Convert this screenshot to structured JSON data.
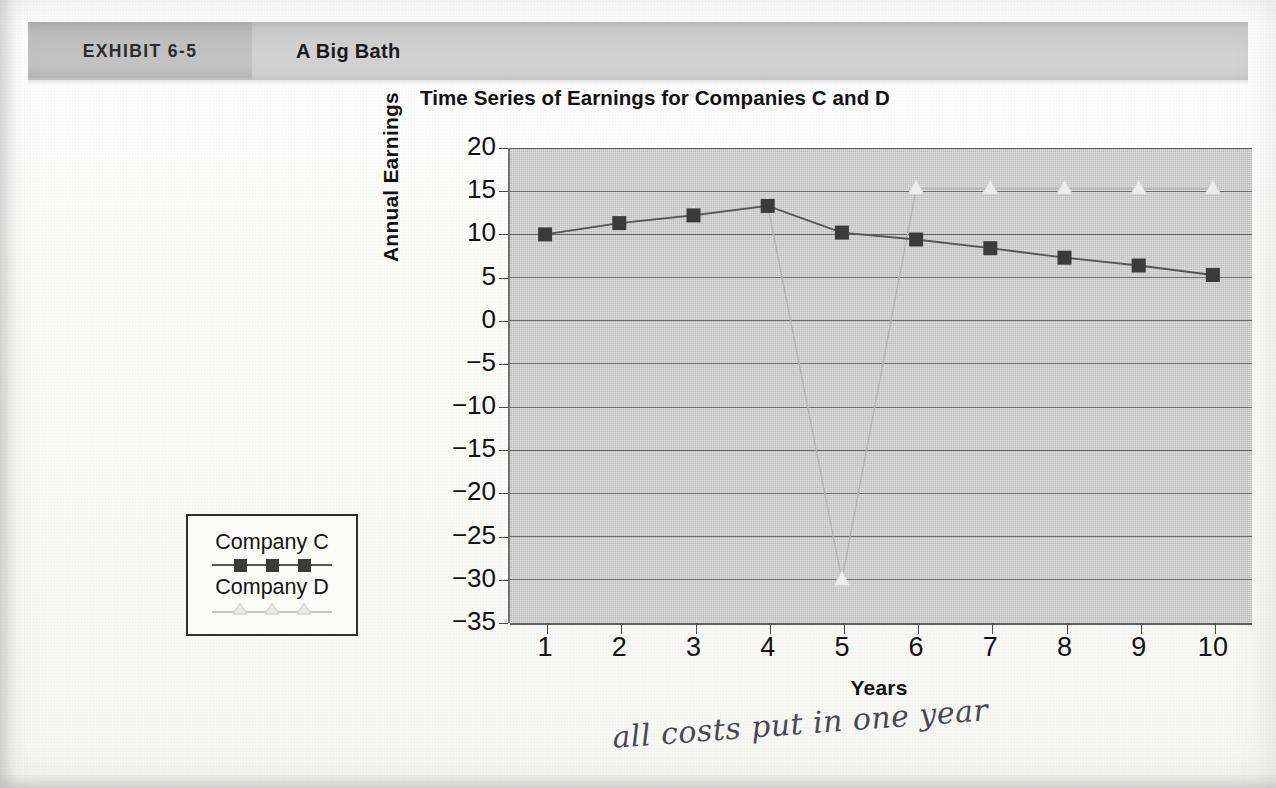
{
  "header": {
    "exhibit_label": "EXHIBIT 6-5",
    "title": "A Big Bath"
  },
  "chart_title": "Time Series of Earnings for Companies C and D",
  "legend": {
    "series_c_label": "Company C",
    "series_d_label": "Company D"
  },
  "annotation": {
    "handwritten_note": "all costs put in one year"
  },
  "colors": {
    "plot_background": "#c9c9c9",
    "gridline": "#6b6b6b",
    "series_c_marker": "#3b3b3b",
    "series_c_line": "#555555",
    "series_d_marker": "#ededed",
    "series_d_line": "#b0b0b0",
    "header_bar": "#d2d2d2",
    "exhibit_block": "#bdbdbd",
    "text": "#111111"
  },
  "chart_data": {
    "type": "line",
    "title": "Time Series of Earnings for Companies C and D",
    "xlabel": "Years",
    "ylabel": "Annual Earnings",
    "x": [
      1,
      2,
      3,
      4,
      5,
      6,
      7,
      8,
      9,
      10
    ],
    "xtick_labels": [
      "1",
      "2",
      "3",
      "4",
      "5",
      "6",
      "7",
      "8",
      "9",
      "10"
    ],
    "ytick_labels": [
      "20",
      "15",
      "10",
      "5",
      "0",
      "−5",
      "−10",
      "−15",
      "−20",
      "−25",
      "−30",
      "−35"
    ],
    "ytick_values": [
      20,
      15,
      10,
      5,
      0,
      -5,
      -10,
      -15,
      -20,
      -25,
      -30,
      -35
    ],
    "ylim": [
      -35,
      20
    ],
    "xlim": [
      0.5,
      10.5
    ],
    "grid": true,
    "legend_position": "outside-left",
    "series": [
      {
        "name": "Company C",
        "marker": "square",
        "color": "#3b3b3b",
        "values": [
          10.0,
          11.3,
          12.2,
          13.3,
          10.2,
          9.4,
          8.4,
          7.3,
          6.4,
          5.3
        ]
      },
      {
        "name": "Company D",
        "marker": "triangle",
        "color": "#ededed",
        "values": [
          10.0,
          11.3,
          12.3,
          13.4,
          -30.0,
          15.3,
          15.3,
          15.3,
          15.3,
          15.3
        ]
      }
    ]
  }
}
